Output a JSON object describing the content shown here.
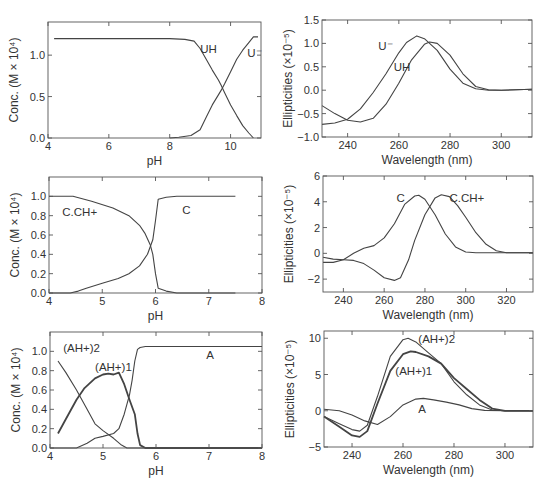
{
  "chart_data": [
    {
      "id": "p1",
      "type": "line",
      "title": "",
      "xlabel": "pH",
      "ylabel": "Conc. (M × 10⁴)",
      "xlim": [
        4,
        11
      ],
      "ylim": [
        0,
        1.4
      ],
      "xticks": [
        4,
        6,
        8,
        10
      ],
      "yticks": [
        0.0,
        0.5,
        1.0
      ],
      "ytick_labels": [
        "0.0",
        "0.5",
        "1.0"
      ],
      "grid": false,
      "frame": {
        "x": 48,
        "y": 22,
        "w": 213,
        "h": 116
      },
      "series": [
        {
          "name": "UH",
          "x": [
            4.2,
            5,
            6,
            7,
            8,
            8.5,
            8.8,
            9.0,
            9.2,
            9.4,
            9.6,
            9.7,
            9.8,
            10.0,
            10.2,
            10.4,
            10.6,
            10.75
          ],
          "y": [
            1.2,
            1.2,
            1.2,
            1.2,
            1.2,
            1.19,
            1.17,
            1.08,
            0.95,
            0.82,
            0.7,
            0.63,
            0.55,
            0.4,
            0.27,
            0.15,
            0.06,
            0.0
          ]
        },
        {
          "name": "U⁻",
          "x": [
            8.0,
            8.3,
            8.7,
            9.0,
            9.2,
            9.4,
            9.6,
            9.7,
            9.8,
            10.0,
            10.2,
            10.4,
            10.6,
            10.75,
            10.9
          ],
          "y": [
            0.0,
            0.01,
            0.03,
            0.1,
            0.25,
            0.4,
            0.52,
            0.58,
            0.65,
            0.8,
            0.95,
            1.06,
            1.15,
            1.22,
            1.22
          ]
        }
      ],
      "labels": [
        {
          "text": "UH",
          "x": 9.0,
          "y": 1.02
        },
        {
          "text": "U⁻",
          "x": 10.55,
          "y": 0.98
        }
      ]
    },
    {
      "id": "p2",
      "type": "line",
      "title": "",
      "xlabel": "Wavelength (nm)",
      "ylabel": "Ellipticities (×10⁻⁵)",
      "xlim": [
        230,
        312
      ],
      "ylim": [
        -1.0,
        1.5
      ],
      "xticks": [
        240,
        260,
        280,
        300
      ],
      "yticks": [
        -1.0,
        -0.5,
        0.0,
        0.5,
        1.0,
        1.5
      ],
      "ytick_labels": [
        "−1.0",
        "−0.5",
        "0.0",
        "0.5",
        "1.0",
        "1.5"
      ],
      "grid": false,
      "frame": {
        "x": 322,
        "y": 20,
        "w": 210,
        "h": 117
      },
      "series": [
        {
          "name": "U⁻",
          "x": [
            230,
            235,
            240,
            245,
            250,
            255,
            260,
            263,
            267,
            270,
            275,
            280,
            285,
            290,
            295,
            300,
            312
          ],
          "y": [
            -0.73,
            -0.7,
            -0.62,
            -0.4,
            -0.05,
            0.35,
            0.8,
            1.02,
            1.16,
            1.1,
            0.85,
            0.45,
            0.15,
            0.03,
            0.0,
            0.0,
            0.02
          ]
        },
        {
          "name": "UH",
          "x": [
            230,
            235,
            240,
            245,
            250,
            255,
            260,
            265,
            270,
            272,
            275,
            280,
            285,
            290,
            295,
            300,
            312
          ],
          "y": [
            -0.33,
            -0.5,
            -0.64,
            -0.68,
            -0.6,
            -0.3,
            0.15,
            0.65,
            0.98,
            1.03,
            1.0,
            0.75,
            0.35,
            0.08,
            0.01,
            0.0,
            0.02
          ]
        }
      ],
      "labels": [
        {
          "text": "U⁻",
          "x": 252,
          "y": 0.85
        },
        {
          "text": "UH",
          "x": 258,
          "y": 0.4
        }
      ]
    },
    {
      "id": "p3",
      "type": "line",
      "title": "",
      "xlabel": "pH",
      "ylabel": "Conc. (M × 10⁴)",
      "xlim": [
        4,
        8
      ],
      "ylim": [
        0,
        1.2
      ],
      "xticks": [
        4,
        5,
        6,
        7,
        8
      ],
      "yticks": [
        0.0,
        0.2,
        0.4,
        0.6,
        0.8,
        1.0
      ],
      "ytick_labels": [
        "0.0",
        "0.2",
        "0.4",
        "0.6",
        "0.8",
        "1.0"
      ],
      "grid": false,
      "frame": {
        "x": 49,
        "y": 177,
        "w": 213,
        "h": 116
      },
      "series": [
        {
          "name": "C.CH+",
          "x": [
            4.0,
            4.45,
            4.8,
            5.2,
            5.5,
            5.7,
            5.8,
            5.9,
            5.95,
            6.0,
            6.05,
            6.2,
            6.4,
            7.5
          ],
          "y": [
            1.0,
            1.0,
            0.95,
            0.88,
            0.8,
            0.7,
            0.62,
            0.5,
            0.4,
            0.2,
            0.05,
            0.02,
            0.0,
            0.0
          ]
        },
        {
          "name": "C",
          "x": [
            4.0,
            4.4,
            4.55,
            4.7,
            5.0,
            5.3,
            5.5,
            5.7,
            5.85,
            5.95,
            6.0,
            6.05,
            6.2,
            6.4,
            7.5
          ],
          "y": [
            0.0,
            0.0,
            0.02,
            0.05,
            0.1,
            0.15,
            0.2,
            0.28,
            0.4,
            0.55,
            0.75,
            0.97,
            0.99,
            1.0,
            1.0
          ]
        }
      ],
      "labels": [
        {
          "text": "C.CH+",
          "x": 4.25,
          "y": 0.8
        },
        {
          "text": "C",
          "x": 6.5,
          "y": 0.82
        }
      ]
    },
    {
      "id": "p4",
      "type": "line",
      "title": "",
      "xlabel": "Wavelength (nm)",
      "ylabel": "Ellipticities (×10⁻⁵)",
      "xlim": [
        230,
        333
      ],
      "ylim": [
        -3,
        6
      ],
      "xticks": [
        240,
        260,
        280,
        300,
        320
      ],
      "yticks": [
        -2,
        0,
        2,
        4,
        6
      ],
      "ytick_labels": [
        "−2",
        "0",
        "2",
        "4",
        "6"
      ],
      "grid": false,
      "frame": {
        "x": 323,
        "y": 176,
        "w": 210,
        "h": 116
      },
      "series": [
        {
          "name": "C",
          "x": [
            230,
            235,
            240,
            245,
            250,
            255,
            260,
            265,
            270,
            275,
            277,
            280,
            285,
            290,
            295,
            300,
            305,
            310,
            333
          ],
          "y": [
            -0.7,
            -0.7,
            -0.5,
            0.0,
            0.4,
            0.6,
            1.2,
            2.3,
            3.8,
            4.45,
            4.5,
            4.2,
            3.0,
            1.5,
            0.5,
            0.1,
            0.05,
            0.05,
            0.05
          ]
        },
        {
          "name": "C.CH+",
          "x": [
            230,
            235,
            240,
            245,
            250,
            255,
            260,
            265,
            268,
            272,
            275,
            280,
            285,
            288,
            292,
            296,
            300,
            305,
            310,
            315,
            320,
            333
          ],
          "y": [
            -0.3,
            -0.45,
            -0.5,
            -0.55,
            -0.8,
            -1.3,
            -1.9,
            -2.1,
            -1.9,
            -0.5,
            1.0,
            3.0,
            4.3,
            4.55,
            4.4,
            3.7,
            2.8,
            1.6,
            0.7,
            0.2,
            0.05,
            0.05
          ]
        }
      ],
      "labels": [
        {
          "text": "C",
          "x": 266,
          "y": 4.0
        },
        {
          "text": "C.CH+",
          "x": 292,
          "y": 4.0
        }
      ]
    },
    {
      "id": "p5",
      "type": "line",
      "title": "",
      "xlabel": "pH",
      "ylabel": "Conc. (M × 10⁴)",
      "xlim": [
        4,
        8
      ],
      "ylim": [
        0,
        1.2
      ],
      "xticks": [
        4,
        5,
        6,
        7,
        8
      ],
      "yticks": [
        0.0,
        0.2,
        0.4,
        0.6,
        0.8,
        1.0
      ],
      "ytick_labels": [
        "0.0",
        "0.2",
        "0.4",
        "0.6",
        "0.8",
        "1.0"
      ],
      "grid": false,
      "frame": {
        "x": 50,
        "y": 332,
        "w": 212,
        "h": 116
      },
      "series": [
        {
          "name": "(AH+)2",
          "bold": false,
          "x": [
            4.15,
            4.3,
            4.5,
            4.7,
            4.85,
            5.0,
            5.2,
            5.35,
            5.45,
            5.5,
            8.0
          ],
          "y": [
            0.9,
            0.78,
            0.6,
            0.4,
            0.25,
            0.18,
            0.1,
            0.03,
            0.0,
            0.0,
            0.0
          ]
        },
        {
          "name": "(AH+)1",
          "bold": true,
          "x": [
            4.15,
            4.3,
            4.5,
            4.65,
            4.85,
            5.0,
            5.1,
            5.2,
            5.3,
            5.4,
            5.5,
            5.6,
            5.65,
            5.7,
            5.8,
            6.0,
            8.0
          ],
          "y": [
            0.15,
            0.3,
            0.5,
            0.62,
            0.72,
            0.76,
            0.77,
            0.76,
            0.78,
            0.66,
            0.5,
            0.35,
            0.15,
            0.03,
            0.0,
            0.0,
            0.0
          ]
        },
        {
          "name": "A",
          "bold": false,
          "x": [
            4.0,
            4.5,
            4.7,
            4.85,
            5.0,
            5.2,
            5.3,
            5.4,
            5.5,
            5.55,
            5.6,
            5.65,
            5.7,
            5.8,
            6.0,
            8.0
          ],
          "y": [
            0.0,
            0.0,
            0.05,
            0.1,
            0.12,
            0.15,
            0.2,
            0.35,
            0.55,
            0.7,
            0.9,
            1.02,
            1.04,
            1.05,
            1.05,
            1.05
          ]
        }
      ],
      "labels": [
        {
          "text": "(AH+)2",
          "x": 4.25,
          "y": 0.99
        },
        {
          "text": "(AH+)1",
          "x": 4.85,
          "y": 0.8
        },
        {
          "text": "A",
          "x": 6.95,
          "y": 0.92
        }
      ]
    },
    {
      "id": "p6",
      "type": "line",
      "title": "",
      "xlabel": "Wavelength (nm)",
      "ylabel": "Ellipticities (×10⁻⁵)",
      "xlim": [
        229,
        311
      ],
      "ylim": [
        -5,
        11
      ],
      "xticks": [
        240,
        260,
        280,
        300
      ],
      "yticks": [
        -5,
        0,
        5,
        10
      ],
      "ytick_labels": [
        "−5",
        "0",
        "5",
        "10"
      ],
      "grid": false,
      "frame": {
        "x": 324,
        "y": 331,
        "w": 209,
        "h": 116
      },
      "series": [
        {
          "name": "(AH+)2",
          "bold": false,
          "x": [
            229,
            235,
            240,
            243,
            246,
            250,
            255,
            260,
            262,
            265,
            270,
            275,
            280,
            285,
            290,
            295,
            300,
            311
          ],
          "y": [
            -0.8,
            -1.8,
            -2.6,
            -2.8,
            -2.0,
            2.0,
            7.5,
            9.8,
            10.0,
            9.5,
            8.0,
            6.5,
            4.0,
            2.2,
            0.8,
            0.1,
            0.0,
            0.0
          ]
        },
        {
          "name": "(AH+)1",
          "bold": true,
          "x": [
            229,
            235,
            240,
            243,
            246,
            250,
            255,
            260,
            263,
            265,
            270,
            275,
            280,
            285,
            290,
            295,
            300,
            311
          ],
          "y": [
            -0.8,
            -2.2,
            -3.4,
            -3.6,
            -2.8,
            1.0,
            5.5,
            7.8,
            8.2,
            8.1,
            7.5,
            6.5,
            4.5,
            3.0,
            1.5,
            0.3,
            0.0,
            0.0
          ]
        },
        {
          "name": "A",
          "bold": false,
          "x": [
            229,
            235,
            240,
            245,
            250,
            255,
            260,
            265,
            268,
            272,
            277,
            282,
            287,
            292,
            300,
            311
          ],
          "y": [
            0.2,
            0.0,
            -0.6,
            -1.4,
            -1.9,
            -0.8,
            0.8,
            1.6,
            1.7,
            1.5,
            1.2,
            0.8,
            0.3,
            0.05,
            0.0,
            0.0
          ]
        }
      ],
      "labels": [
        {
          "text": "(AH+)2",
          "x": 266,
          "y": 9.3
        },
        {
          "text": "(AH+)1",
          "x": 257,
          "y": 5.0
        },
        {
          "text": "A",
          "x": 266,
          "y": -0.3
        }
      ]
    }
  ]
}
